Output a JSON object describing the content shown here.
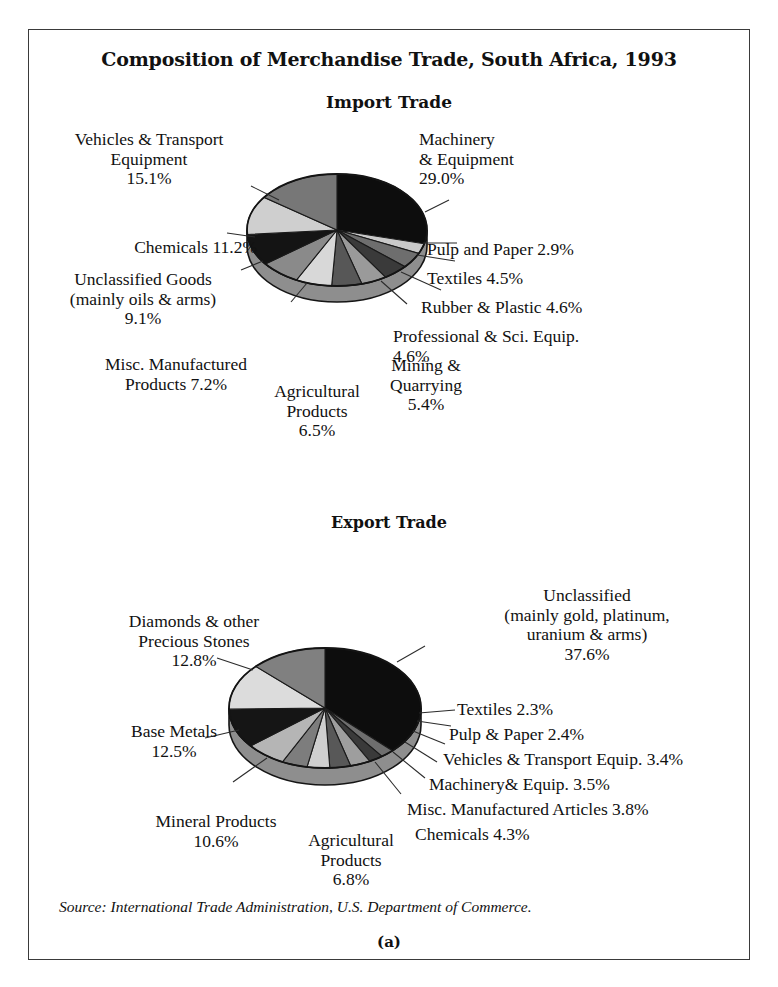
{
  "figure": {
    "main_title": "Composition of Merchandise Trade, South Africa, 1993",
    "import_title": "Import Trade",
    "export_title": "Export Trade",
    "source": "Source: International Trade Administration, U.S. Department of Commerce.",
    "figure_label": "(a)"
  },
  "labels": {
    "import": {
      "machinery": "Machinery\n& Equipment\n29.0%",
      "vehicles": "Vehicles & Transport\nEquipment\n15.1%",
      "chemicals": "Chemicals 11.2%",
      "unclassified": "Unclassified Goods\n(mainly oils & arms)\n9.1%",
      "misc": "Misc. Manufactured\nProducts 7.2%",
      "agricultural": "Agricultural\nProducts\n6.5%",
      "mining": "Mining &\nQuarrying\n5.4%",
      "professional": "Professional & Sci. Equip.\n4.6%",
      "rubber": "Rubber & Plastic 4.6%",
      "textiles": "Textiles 4.5%",
      "pulp": "Pulp and Paper 2.9%"
    },
    "export": {
      "unclassified": "Unclassified\n(mainly gold, platinum,\nuranium & arms)\n37.6%",
      "diamonds": "Diamonds & other\nPrecious Stones\n12.8%",
      "base_metals": "Base Metals\n12.5%",
      "mineral": "Mineral Products\n10.6%",
      "agricultural": "Agricultural\nProducts\n6.8%",
      "chemicals": "Chemicals 4.3%",
      "misc": "Misc. Manufactured Articles 3.8%",
      "machinery": "Machinery& Equip. 3.5%",
      "vehicles": "Vehicles & Transport Equip. 3.4%",
      "pulp": "Pulp & Paper 2.4%",
      "textiles": "Textiles 2.3%"
    }
  },
  "chart_data": [
    {
      "type": "pie",
      "title": "Import Trade",
      "unit": "percent",
      "categories": [
        "Machinery & Equipment",
        "Pulp and Paper",
        "Textiles",
        "Rubber & Plastic",
        "Professional & Sci. Equip.",
        "Mining & Quarrying",
        "Agricultural Products",
        "Misc. Manufactured Products",
        "Unclassified Goods (mainly oils & arms)",
        "Chemicals",
        "Vehicles & Transport Equipment"
      ],
      "values": [
        29.0,
        2.9,
        4.5,
        4.6,
        4.6,
        5.4,
        6.5,
        7.2,
        9.1,
        11.2,
        15.1
      ],
      "colors": [
        "#0d0d0d",
        "#c9c9c9",
        "#6e6e6e",
        "#3a3a3a",
        "#9a9a9a",
        "#575757",
        "#d8d8d8",
        "#8a8a8a",
        "#141414",
        "#cfcfcf",
        "#777777"
      ],
      "start_angle_deg": 0,
      "direction": "clockwise",
      "three_d": true
    },
    {
      "type": "pie",
      "title": "Export Trade",
      "unit": "percent",
      "categories": [
        "Unclassified (mainly gold, platinum, uranium & arms)",
        "Textiles",
        "Pulp & Paper",
        "Vehicles & Transport Equip.",
        "Machinery & Equip.",
        "Misc. Manufactured Articles",
        "Chemicals",
        "Agricultural Products",
        "Mineral Products",
        "Base Metals",
        "Diamonds & other Precious Stones"
      ],
      "values": [
        37.6,
        2.3,
        2.4,
        3.4,
        3.5,
        3.8,
        4.3,
        6.8,
        10.6,
        12.5,
        12.8
      ],
      "colors": [
        "#0d0d0d",
        "#6e6e6e",
        "#3a3a3a",
        "#9e9e9e",
        "#585858",
        "#cfcfcf",
        "#7d7d7d",
        "#b5b5b5",
        "#151515",
        "#dcdcdc",
        "#808080"
      ],
      "start_angle_deg": 0,
      "direction": "clockwise",
      "three_d": true
    }
  ]
}
